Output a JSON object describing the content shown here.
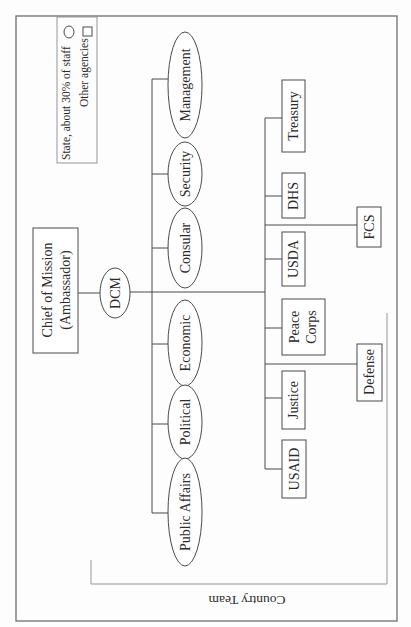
{
  "diagram": {
    "type": "org-chart",
    "orientation": "rotated-90-ccw",
    "colors": {
      "line": "#4a4a4a",
      "frame": "#6f6f6f",
      "text": "#2b2b2b",
      "background": "#fdfdfd"
    },
    "legend": {
      "items": [
        {
          "label": "State, about 30% of staff",
          "shape": "ellipse"
        },
        {
          "label": "Other agencies",
          "shape": "rectangle"
        }
      ]
    },
    "root": {
      "id": "chief",
      "label_lines": [
        "Chief of Mission",
        "(Ambassador)"
      ],
      "shape": "rectangle"
    },
    "deputy": {
      "id": "dcm",
      "label": "DCM",
      "shape": "ellipse"
    },
    "state_sections": [
      {
        "id": "management",
        "label": "Management",
        "shape": "ellipse"
      },
      {
        "id": "security",
        "label": "Security",
        "shape": "ellipse"
      },
      {
        "id": "consular",
        "label": "Consular",
        "shape": "ellipse"
      },
      {
        "id": "economic",
        "label": "Economic",
        "shape": "ellipse"
      },
      {
        "id": "political",
        "label": "Political",
        "shape": "ellipse"
      },
      {
        "id": "public-affairs",
        "label": "Public Affairs",
        "shape": "ellipse"
      }
    ],
    "other_agencies": [
      {
        "id": "treasury",
        "label_lines": [
          "Treasury"
        ],
        "shape": "rectangle",
        "tier": 1
      },
      {
        "id": "dhs",
        "label_lines": [
          "DHS"
        ],
        "shape": "rectangle",
        "tier": 1
      },
      {
        "id": "fcs",
        "label_lines": [
          "FCS"
        ],
        "shape": "rectangle",
        "tier": 2
      },
      {
        "id": "usda",
        "label_lines": [
          "USDA"
        ],
        "shape": "rectangle",
        "tier": 1
      },
      {
        "id": "peace-corps",
        "label_lines": [
          "Peace",
          "Corps"
        ],
        "shape": "rectangle",
        "tier": 1
      },
      {
        "id": "defense",
        "label_lines": [
          "Defense"
        ],
        "shape": "rectangle",
        "tier": 2
      },
      {
        "id": "justice",
        "label_lines": [
          "Justice"
        ],
        "shape": "rectangle",
        "tier": 1
      },
      {
        "id": "usaid",
        "label_lines": [
          "USAID"
        ],
        "shape": "rectangle",
        "tier": 1
      }
    ],
    "group_bracket": {
      "label": "Country Team"
    }
  }
}
